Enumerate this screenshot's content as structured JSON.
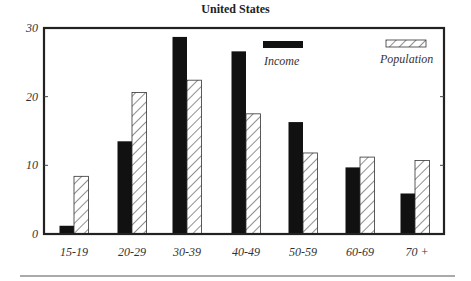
{
  "chart_data": {
    "type": "bar",
    "title": "United States",
    "xlabel": "",
    "ylabel": "",
    "ylim": [
      0,
      30
    ],
    "yticks": [
      0,
      10,
      20,
      30
    ],
    "grid": false,
    "legend_position": "top-right inside",
    "categories": [
      "15-19",
      "20-29",
      "30-39",
      "40-49",
      "50-59",
      "60-69",
      "70 +"
    ],
    "series": [
      {
        "name": "Income",
        "style": "solid black",
        "values": [
          1.2,
          13.5,
          28.7,
          26.6,
          16.3,
          9.7,
          5.9
        ]
      },
      {
        "name": "Population",
        "style": "diagonal hatch",
        "values": [
          8.4,
          20.6,
          22.4,
          17.5,
          11.8,
          11.2,
          10.7
        ]
      }
    ]
  },
  "colors": {
    "income": "#111111",
    "population_fill": "#ffffff",
    "frame": "#222222"
  }
}
